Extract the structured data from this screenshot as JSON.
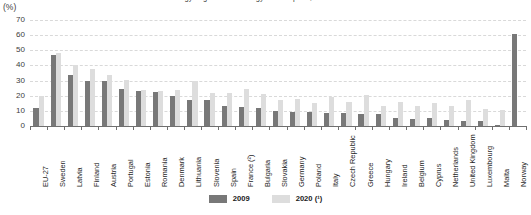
{
  "chart_data": {
    "type": "bar",
    "title": "Share of renewable energy in gross final energy consumption, 2009 and 2020",
    "subtitle": "",
    "unit_label": "(%)",
    "xlabel": "",
    "ylabel": "",
    "ylim": [
      0,
      70
    ],
    "ytick_step": 10,
    "yticks": [
      "0",
      "10",
      "20",
      "30",
      "40",
      "50",
      "60",
      "70"
    ],
    "grid": true,
    "legend_position": "bottom-center",
    "categories": [
      "EU-27",
      "Sweden",
      "Latvia",
      "Finland",
      "Austria",
      "Portugal",
      "Estonia",
      "Romania",
      "Denmark",
      "Lithuania",
      "Slovenia",
      "Spain",
      "France (²)",
      "Bulgaria",
      "Slovakia",
      "Germany",
      "Poland",
      "Italy",
      "Czech Republic",
      "Greece",
      "Hungary",
      "Ireland",
      "Belgium",
      "Cyprus",
      "Netherlands",
      "United Kingdom",
      "Luxembourg",
      "Malta",
      "Norway"
    ],
    "series": [
      {
        "name": "2009",
        "color": "#787878",
        "values": [
          12,
          47,
          34,
          30,
          29.5,
          24.5,
          23,
          22.5,
          20,
          17,
          17,
          13,
          12.5,
          12,
          10,
          9.5,
          9,
          8.5,
          8.5,
          8,
          8,
          5,
          4.5,
          5.5,
          4,
          3,
          3,
          0.5,
          61
        ]
      },
      {
        "name": "2020 (¹)",
        "color": "#dddddd",
        "values": [
          19.5,
          48,
          40,
          37.5,
          33.5,
          30.5,
          24,
          23,
          23.5,
          30,
          22,
          21.5,
          24.5,
          21,
          17,
          18,
          15.5,
          19,
          16,
          20.5,
          13.5,
          16,
          13,
          15,
          13.5,
          17,
          11.5,
          10.5,
          null
        ]
      }
    ],
    "notes": []
  },
  "legend": {
    "items": [
      {
        "label": "2009",
        "color": "#787878"
      },
      {
        "label": "2020 (¹)",
        "color": "#dddddd"
      }
    ]
  }
}
